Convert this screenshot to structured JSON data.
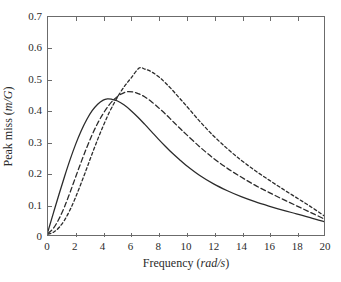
{
  "chart_data": {
    "type": "line",
    "title": "",
    "xlabel": "Frequency (rad/s)",
    "ylabel": "Peak miss (m/G)",
    "xlabel_plain": "Frequency",
    "xlabel_units": "rad/s",
    "ylabel_plain": "Peak miss",
    "ylabel_units": "m/G",
    "xlim": [
      0,
      20
    ],
    "ylim": [
      0,
      0.7
    ],
    "grid": false,
    "legend": "none",
    "xticks": [
      0,
      2,
      4,
      6,
      8,
      10,
      12,
      14,
      16,
      18,
      20
    ],
    "xtick_labels": [
      "0",
      "2",
      "4",
      "6",
      "8",
      "10",
      "12",
      "14",
      "16",
      "18",
      "20"
    ],
    "yticks": [
      0,
      0.1,
      0.2,
      0.3,
      0.4,
      0.5,
      0.6,
      0.7
    ],
    "ytick_labels": [
      "0",
      "0.1",
      "0.2",
      "0.3",
      "0.4",
      "0.5",
      "0.6",
      "0.7"
    ],
    "axis_color": "#6b6b6b",
    "line_color": "#2b2b2b",
    "series": [
      {
        "name": "curve-1",
        "style": "solid",
        "dash": "none",
        "peak_x": 4.3,
        "peak_y": 0.437,
        "x": [
          0,
          0.4,
          0.8,
          1.2,
          1.6,
          2.0,
          2.4,
          2.8,
          3.2,
          3.6,
          4.0,
          4.3,
          4.6,
          5.0,
          5.5,
          6.0,
          6.5,
          7.0,
          7.5,
          8.0,
          8.5,
          9.0,
          9.5,
          10.0,
          11.0,
          12.0,
          13.0,
          14.0,
          15.0,
          16.0,
          17.0,
          18.0,
          19.0,
          20.0
        ],
        "y": [
          0.012,
          0.072,
          0.131,
          0.188,
          0.242,
          0.291,
          0.334,
          0.37,
          0.399,
          0.42,
          0.433,
          0.437,
          0.436,
          0.431,
          0.418,
          0.4,
          0.379,
          0.356,
          0.332,
          0.308,
          0.285,
          0.263,
          0.243,
          0.224,
          0.191,
          0.164,
          0.142,
          0.123,
          0.107,
          0.093,
          0.08,
          0.068,
          0.056,
          0.043
        ]
      },
      {
        "name": "curve-2",
        "style": "dashed",
        "dash": "5,3",
        "peak_x": 5.7,
        "peak_y": 0.46,
        "x": [
          0,
          0.4,
          0.8,
          1.2,
          1.6,
          2.0,
          2.4,
          2.8,
          3.2,
          3.6,
          4.0,
          4.4,
          4.8,
          5.2,
          5.7,
          6.2,
          6.6,
          7.0,
          7.5,
          8.0,
          8.5,
          9.0,
          9.5,
          10.0,
          11.0,
          12.0,
          13.0,
          14.0,
          15.0,
          16.0,
          17.0,
          18.0,
          19.0,
          20.0
        ],
        "y": [
          0.005,
          0.022,
          0.052,
          0.091,
          0.137,
          0.186,
          0.234,
          0.28,
          0.322,
          0.359,
          0.39,
          0.416,
          0.436,
          0.45,
          0.46,
          0.459,
          0.453,
          0.444,
          0.428,
          0.409,
          0.389,
          0.367,
          0.345,
          0.324,
          0.283,
          0.246,
          0.214,
          0.186,
          0.16,
          0.137,
          0.115,
          0.094,
          0.073,
          0.052
        ]
      },
      {
        "name": "curve-3",
        "style": "dashed-fine",
        "dash": "3,2.5",
        "peak_x": 6.6,
        "peak_y": 0.536,
        "x": [
          0,
          0.4,
          0.8,
          1.2,
          1.6,
          2.0,
          2.4,
          2.8,
          3.2,
          3.6,
          4.0,
          4.4,
          4.8,
          5.2,
          5.6,
          6.0,
          6.6,
          7.0,
          7.5,
          8.0,
          8.5,
          9.0,
          9.5,
          10.0,
          11.0,
          12.0,
          13.0,
          14.0,
          15.0,
          16.0,
          17.0,
          18.0,
          19.0,
          20.0
        ],
        "y": [
          0.003,
          0.009,
          0.024,
          0.048,
          0.081,
          0.121,
          0.166,
          0.213,
          0.261,
          0.307,
          0.35,
          0.39,
          0.424,
          0.455,
          0.481,
          0.503,
          0.536,
          0.533,
          0.524,
          0.509,
          0.489,
          0.466,
          0.441,
          0.416,
          0.365,
          0.318,
          0.277,
          0.24,
          0.207,
          0.177,
          0.148,
          0.12,
          0.092,
          0.062
        ]
      }
    ]
  }
}
